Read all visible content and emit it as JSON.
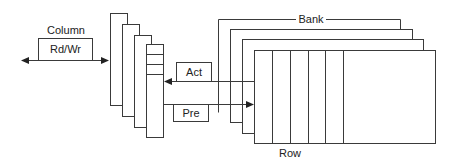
{
  "diagram": {
    "labels": {
      "column": "Column",
      "rdwr": "Rd/Wr",
      "act": "Act",
      "pre": "Pre",
      "bank": "Bank",
      "row": "Row"
    },
    "colors": {
      "stroke": "#3a3a3a",
      "background": "#ffffff",
      "text": "#222222"
    },
    "column_plates": 4,
    "bank_plates": 4,
    "front_bank_row_dividers": 5,
    "column_plate_row_dividers": 3
  }
}
